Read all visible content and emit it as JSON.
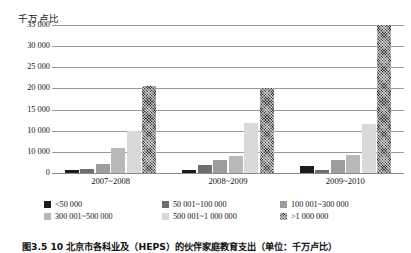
{
  "chart_data": {
    "type": "bar",
    "title": "",
    "ylabel": "千万卢比",
    "xlabel": "",
    "ylim": [
      0,
      35000
    ],
    "grid": true,
    "legend_position": "bottom",
    "categories": [
      "2007~2008",
      "2008~2009",
      "2009~2010"
    ],
    "ytick_labels": [
      "35 000",
      "30 000",
      "25 000",
      "20 000",
      "15 000",
      "10 000",
      "10 000",
      "0"
    ],
    "ytick_values": [
      35000,
      30000,
      25000,
      20000,
      15000,
      10000,
      5000,
      0
    ],
    "series": [
      {
        "name": "<50 000",
        "color": "#1c1c1c",
        "values": [
          620,
          700,
          1650
        ]
      },
      {
        "name": "50 001~100 000",
        "color": "#6e6e6e",
        "values": [
          900,
          1900,
          700
        ]
      },
      {
        "name": "100 001~300 000",
        "color": "#9d9d9d",
        "values": [
          2100,
          3100,
          3000
        ]
      },
      {
        "name": "300 001~500 000",
        "color": "#b9b9b9",
        "values": [
          5800,
          4100,
          4300
        ]
      },
      {
        "name": "500 001~1 000 000",
        "color": "#d9d9d9",
        "values": [
          9900,
          11800,
          11500
        ]
      },
      {
        "name": ">1 000 000",
        "color": "#3a3a3a",
        "values": [
          20500,
          20200,
          35000
        ]
      }
    ]
  },
  "legend": {
    "items": [
      "<50 000",
      "50 001~100 000",
      "100 001~300 000",
      "300 001~500 000",
      "500 001~1 000 000",
      ">1 000 000"
    ]
  },
  "caption": {
    "text": "图3.5 10 北京市各科业及（HEPS）的伙伴家庭教育支出（单位：千万卢比）"
  }
}
